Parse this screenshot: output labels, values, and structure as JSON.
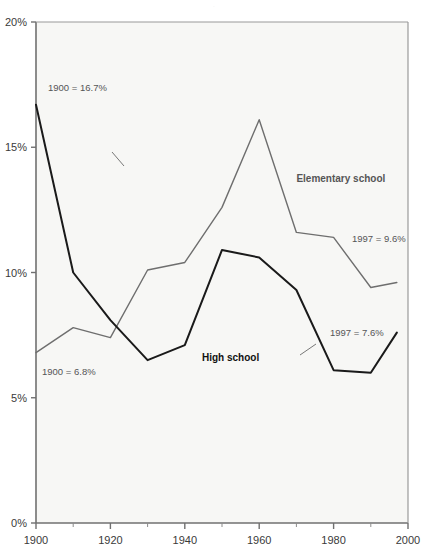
{
  "title_strip": {
    "text": "."
  },
  "chart_data": {
    "type": "line",
    "title": "",
    "subtitle": "",
    "xlabel": "",
    "ylabel": "",
    "xlim": [
      1900,
      2000
    ],
    "ylim": [
      0,
      20
    ],
    "grid": false,
    "legend_position": "inline-labels",
    "background": "#f7f7f5",
    "x": [
      1900,
      1910,
      1920,
      1930,
      1940,
      1950,
      1960,
      1970,
      1980,
      1990,
      1997
    ],
    "xticks": [
      1900,
      1920,
      1940,
      1960,
      1980,
      2000
    ],
    "xticklabels": [
      "1900",
      "1920",
      "1940",
      "1960",
      "1980",
      "2000"
    ],
    "xminorticks": [
      1910,
      1930,
      1950,
      1970,
      1990
    ],
    "yticks": [
      0,
      5,
      10,
      15,
      20
    ],
    "yticklabels": [
      "0%",
      "5%",
      "10%",
      "15%",
      "20%"
    ],
    "series": [
      {
        "name": "Elementary school",
        "color": "#6e6e6e",
        "linewidth": 1.4,
        "values": [
          6.8,
          7.8,
          7.4,
          10.1,
          10.4,
          12.6,
          16.1,
          11.6,
          11.4,
          9.4,
          9.6
        ],
        "label_text": "Elementary school",
        "label_x": 1970,
        "label_y": 13.6,
        "start_annotation": "1900 = 6.8%",
        "end_annotation": "1997 = 9.6%"
      },
      {
        "name": "High school",
        "color": "#1a1a1a",
        "linewidth": 2.0,
        "values": [
          16.7,
          10.0,
          8.1,
          6.5,
          7.1,
          10.9,
          10.6,
          9.3,
          6.1,
          6.0,
          7.6
        ],
        "label_text": "High school",
        "label_x": 1960,
        "label_y": 6.45,
        "start_annotation": "1900 = 16.7%",
        "end_annotation": "1997 = 7.6%"
      }
    ],
    "annotations": [
      {
        "id": "elem-start",
        "text": "1900 = 6.8%",
        "x_px": 42,
        "y_px": 375
      },
      {
        "id": "elem-end",
        "text": "1997 = 9.6%",
        "x_px": 352,
        "y_px": 242
      },
      {
        "id": "high-start",
        "text": "1900 = 16.7%",
        "x_px": 48,
        "y_px": 91
      },
      {
        "id": "high-end",
        "text": "1997 = 7.6%",
        "x_px": 330,
        "y_px": 336
      }
    ]
  }
}
